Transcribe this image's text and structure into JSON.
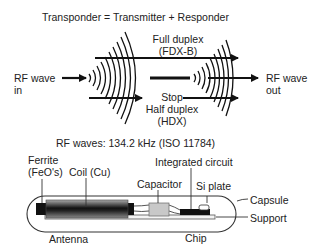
{
  "top": {
    "title": "Transponder = Transmitter + Responder",
    "full_duplex": "Full duplex",
    "fdx": "(FDX-B)",
    "stop": "Stop",
    "half_duplex": "Half duplex",
    "hdx": "(HDX)",
    "rf_in_1": "RF wave",
    "rf_in_2": "in",
    "rf_out_1": "RF wave",
    "rf_out_2": "out"
  },
  "bottom": {
    "title": "RF waves: 134.2 kHz (ISO 11784)",
    "ferrite_1": "Ferrite",
    "ferrite_2": "(FeO's)",
    "coil": "Coil (Cu)",
    "integrated_circuit": "Integrated circuit",
    "capacitor": "Capacitor",
    "si_plate": "Si plate",
    "capsule": "Capsule",
    "support": "Support",
    "antenna": "Antenna",
    "chip": "Chip"
  }
}
